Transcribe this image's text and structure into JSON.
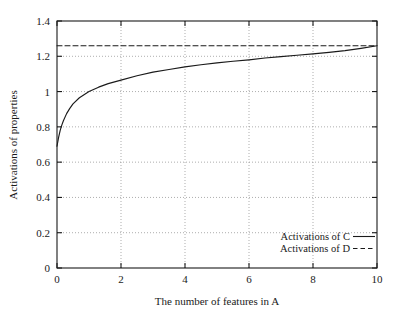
{
  "chart_data": {
    "type": "line",
    "title": "",
    "xlabel": "The number of features in A",
    "ylabel": "Activations of properties",
    "xlim": [
      0,
      10
    ],
    "ylim": [
      0,
      1.4
    ],
    "xticks": [
      "0",
      "2",
      "4",
      "6",
      "8",
      "10"
    ],
    "xtick_values": [
      0,
      2,
      4,
      6,
      8,
      10
    ],
    "yticks": [
      "0",
      "0.2",
      "0.4",
      "0.6",
      "0.8",
      "1",
      "1.2",
      "1.4"
    ],
    "ytick_values": [
      0,
      0.2,
      0.4,
      0.6,
      0.8,
      1.0,
      1.2,
      1.4
    ],
    "grid": true,
    "legend_position": "lower right",
    "series": [
      {
        "name": "Activations of C",
        "style": "solid",
        "color": "#1a1a1a",
        "x": [
          0,
          0.05,
          0.1,
          0.15,
          0.2,
          0.3,
          0.4,
          0.5,
          0.7,
          1.0,
          1.3,
          1.6,
          2.0,
          2.5,
          3.0,
          3.5,
          4.0,
          4.5,
          5.0,
          5.5,
          6.0,
          6.5,
          7.0,
          7.5,
          8.0,
          8.5,
          9.0,
          9.5,
          10.0
        ],
        "values": [
          0.69,
          0.74,
          0.78,
          0.81,
          0.835,
          0.875,
          0.905,
          0.93,
          0.965,
          1.0,
          1.025,
          1.045,
          1.065,
          1.09,
          1.11,
          1.125,
          1.14,
          1.152,
          1.163,
          1.172,
          1.18,
          1.19,
          1.198,
          1.206,
          1.214,
          1.222,
          1.232,
          1.245,
          1.26
        ]
      },
      {
        "name": "Activations of D",
        "style": "dashed",
        "color": "#1a1a1a",
        "x": [
          0,
          10
        ],
        "values": [
          1.26,
          1.26
        ]
      }
    ]
  },
  "legend": {
    "entries": [
      {
        "label": "Activations of C",
        "style": "solid"
      },
      {
        "label": "Activations of D",
        "style": "dashed"
      }
    ]
  },
  "axes": {
    "x_label": "The number of features in A",
    "y_label": "Activations of properties"
  }
}
